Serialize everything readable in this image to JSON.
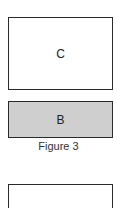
{
  "diagram": {
    "boxes": [
      {
        "id": "C",
        "label": "C",
        "fill": "#ffffff"
      },
      {
        "id": "B",
        "label": "B",
        "fill": "#cfcfcf"
      },
      {
        "id": "unlabeled",
        "label": "",
        "fill": "#ffffff"
      }
    ],
    "caption": "Figure 3"
  }
}
